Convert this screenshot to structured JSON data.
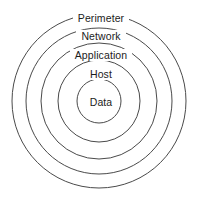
{
  "diagram": {
    "type": "concentric-rings",
    "title": "",
    "stroke_color": "#4a4a4a",
    "text_color": "#1c1c1c",
    "background_color": "#ffffff",
    "center": {
      "x": 99,
      "y": 101
    },
    "rings": [
      {
        "label": "Perimeter",
        "radius": 87,
        "level": 1,
        "label_y": 13
      },
      {
        "label": "Network",
        "radius": 73,
        "level": 2,
        "label_y": 31
      },
      {
        "label": "Application",
        "radius": 58,
        "level": 3,
        "label_y": 50
      },
      {
        "label": "Host",
        "radius": 41,
        "level": 4,
        "label_y": 69
      },
      {
        "label": "Data",
        "radius": 22,
        "level": 5,
        "label_y": 97
      }
    ]
  }
}
